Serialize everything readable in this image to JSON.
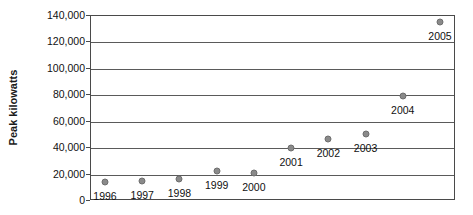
{
  "chart_data": {
    "type": "scatter",
    "title": "",
    "xlabel": "",
    "ylabel": "Peak kilowatts",
    "categories": [
      "1996",
      "1997",
      "1998",
      "1999",
      "2000",
      "2001",
      "2002",
      "2003",
      "2004",
      "2005"
    ],
    "values": [
      14500,
      15000,
      16500,
      22500,
      21000,
      40000,
      47000,
      51000,
      79500,
      135500
    ],
    "point_labels": [
      "1996",
      "1997",
      "1998",
      "1999",
      "2000",
      "2001",
      "2002",
      "2003",
      "2004",
      "2005"
    ],
    "ylim": [
      0,
      140000
    ],
    "ytick_labels": [
      "140,000",
      "120,000",
      "100,000",
      "80,000",
      "60,000",
      "40,000",
      "20,000",
      "0"
    ],
    "ytick_values": [
      140000,
      120000,
      100000,
      80000,
      60000,
      40000,
      20000,
      0
    ],
    "grid": true,
    "grid_axis": "y",
    "legend": "none",
    "marker_color": "#8a8a8a",
    "axis_color": "#4a4a4a",
    "text_color": "#111111",
    "background": "#ffffff"
  }
}
